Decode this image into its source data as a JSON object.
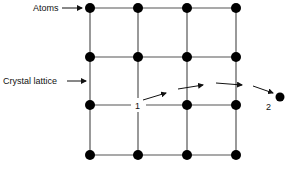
{
  "diagram": {
    "labels": {
      "atoms": "Atoms",
      "crystal_lattice": "Crystal lattice",
      "vacancy_site": "1",
      "displaced_atom": "2"
    },
    "grid": {
      "columns_x": [
        90,
        138,
        187,
        236
      ],
      "rows_y": [
        8,
        57,
        105,
        155
      ],
      "vacancy": {
        "row": 2,
        "col": 1
      }
    },
    "colors": {
      "line": "#555555",
      "atom": "#000000",
      "text": "#111111"
    }
  }
}
